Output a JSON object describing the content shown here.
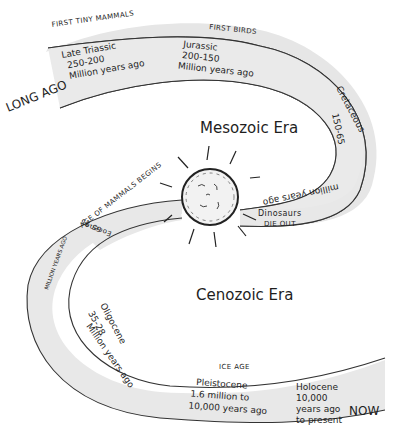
{
  "diagram": {
    "endpoints": {
      "start": "LONG AGO",
      "end": "NOW"
    },
    "eras": [
      {
        "name": "Mesozoic Era"
      },
      {
        "name": "Cenozoic Era"
      }
    ],
    "periods": [
      {
        "name": "Late Triassic",
        "range": "250-200",
        "unit": "Million years ago",
        "note": "FIRST TINY MAMMALS"
      },
      {
        "name": "Jurassic",
        "range": "200-150",
        "unit": "Million years ago",
        "note": "FIRST BIRDS"
      },
      {
        "name": "Cretaceous",
        "range": "150-65",
        "unit": "million years ago"
      },
      {
        "name": "Eocene",
        "range": "65-35",
        "unit": "MILLION YEARS AGO",
        "note": "AGE OF MAMMALS BEGINS"
      },
      {
        "name": "Oligocene",
        "range": "35-28",
        "unit": "Million years ago"
      },
      {
        "name": "Pleistocene",
        "range": "1.6 million to",
        "unit": "10,000 years ago",
        "note": "ICE AGE"
      },
      {
        "name": "Holocene",
        "range": "10,000",
        "unit": "years ago",
        "extra": "to present"
      }
    ],
    "event": {
      "icon": "asteroid-impact",
      "label_line1": "Dinosaurs",
      "label_line2": "DIE OUT"
    },
    "colors": {
      "band_fill": "#e6e6e6",
      "stroke": "#333333",
      "background": "#ffffff"
    }
  }
}
